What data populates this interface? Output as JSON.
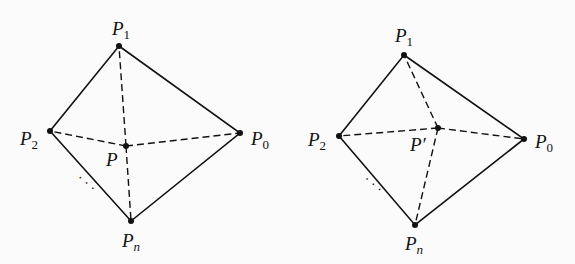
{
  "figures": [
    {
      "id": "left",
      "vertices": {
        "P1": {
          "label": "P",
          "sub": "1",
          "x": 119,
          "y": 46
        },
        "P2": {
          "label": "P",
          "sub": "2",
          "x": 50,
          "y": 131
        },
        "P0": {
          "label": "P",
          "sub": "0",
          "x": 240,
          "y": 133
        },
        "Pn": {
          "label": "P",
          "sub": "n",
          "x": 131,
          "y": 221
        }
      },
      "interior": {
        "label": "P",
        "x": 126,
        "y": 146
      },
      "ellipsis": "· · ·"
    },
    {
      "id": "right",
      "vertices": {
        "P1": {
          "label": "P",
          "sub": "1",
          "x": 404,
          "y": 55
        },
        "P2": {
          "label": "P",
          "sub": "2",
          "x": 339,
          "y": 136
        },
        "P0": {
          "label": "P",
          "sub": "0",
          "x": 524,
          "y": 139
        },
        "Pn": {
          "label": "P",
          "sub": "n",
          "x": 415,
          "y": 225
        }
      },
      "interior": {
        "label": "P′",
        "x": 438,
        "y": 128
      },
      "ellipsis": "· · ·"
    }
  ],
  "colors": {
    "ink": "#111111",
    "background": "#fbfbfb"
  }
}
